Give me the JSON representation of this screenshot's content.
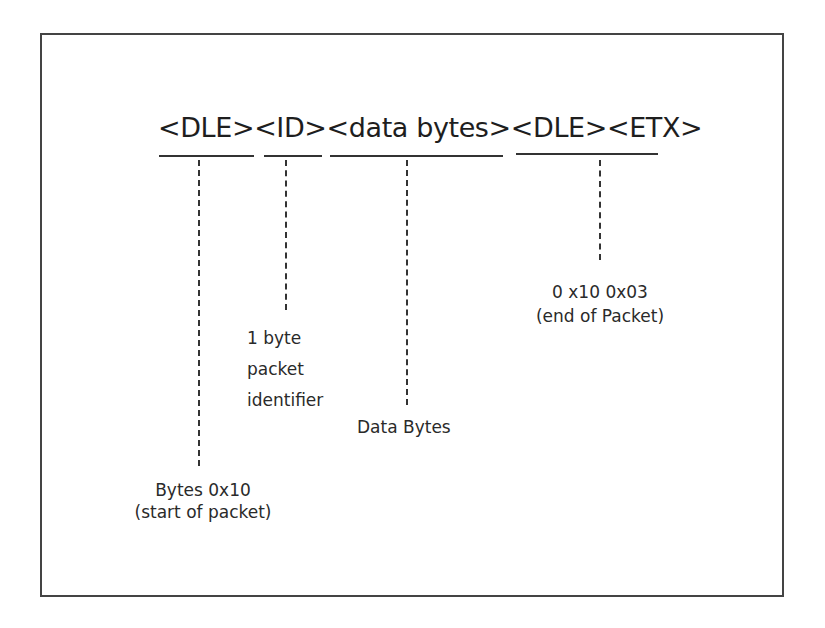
{
  "diagram": {
    "header": "<DLE><ID><data bytes><DLE><ETX>",
    "fields": [
      {
        "name": "DLE",
        "label_lines": [
          "Bytes 0x10",
          "(start of packet)"
        ]
      },
      {
        "name": "ID",
        "label_lines": [
          "1 byte",
          "packet",
          "identifier"
        ]
      },
      {
        "name": "data bytes",
        "label_lines": [
          "Data Bytes"
        ]
      },
      {
        "name": "DLE ETX",
        "label_lines": [
          "0 x10 0x03",
          "(end of Packet)"
        ]
      }
    ]
  }
}
